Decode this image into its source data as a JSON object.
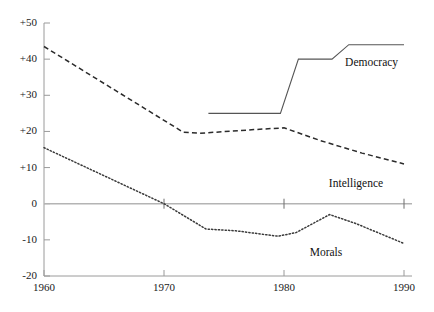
{
  "chart_data": {
    "type": "line",
    "title": "",
    "subtitle": "",
    "xlabel": "",
    "ylabel": "",
    "xlim": [
      1960,
      1990
    ],
    "ylim": [
      -20,
      50
    ],
    "grid": false,
    "legend_position": "inline-right",
    "zero_line": true,
    "x_ticks": [
      "1960",
      "1970",
      "1980",
      "1990"
    ],
    "x_tick_values": [
      1960,
      1970,
      1980,
      1990
    ],
    "y_ticks": [
      "+50",
      "+40",
      "+30",
      "+20",
      "+10",
      "0",
      "-10",
      "-20"
    ],
    "y_tick_values": [
      50,
      40,
      30,
      20,
      10,
      0,
      -10,
      -20
    ],
    "series": [
      {
        "name": "Democracy",
        "style": "solid",
        "color": "#555555",
        "x": [
          1973.7,
          1979.7,
          1981.2,
          1984.0,
          1985.4,
          1990.0
        ],
        "values": [
          25,
          25,
          40,
          40,
          44,
          44
        ],
        "label_x": 1987.3,
        "label_y": 39
      },
      {
        "name": "Intelligence",
        "style": "dashed",
        "color": "#2b2b2b",
        "x": [
          1960.0,
          1971.6,
          1973.0,
          1977.5,
          1980.0,
          1983.0,
          1986.5,
          1990.0
        ],
        "values": [
          43.5,
          19.8,
          19.5,
          20.5,
          21.0,
          17.5,
          14.0,
          11.0
        ],
        "label_x": 1986.0,
        "label_y": 5.5
      },
      {
        "name": "Morals",
        "style": "dotted",
        "color": "#3a3a3a",
        "x": [
          1960.0,
          1970.0,
          1973.5,
          1976.0,
          1979.5,
          1981.0,
          1983.8,
          1986.0,
          1990.0
        ],
        "values": [
          15.5,
          0.0,
          -7.0,
          -7.5,
          -9.0,
          -8.0,
          -3.0,
          -5.5,
          -11.0
        ],
        "label_x": 1983.5,
        "label_y": -13.5
      }
    ],
    "axis_color": "#9a9a9a",
    "zero_line_color": "#b4b4b4",
    "background_color": "#ffffff"
  }
}
